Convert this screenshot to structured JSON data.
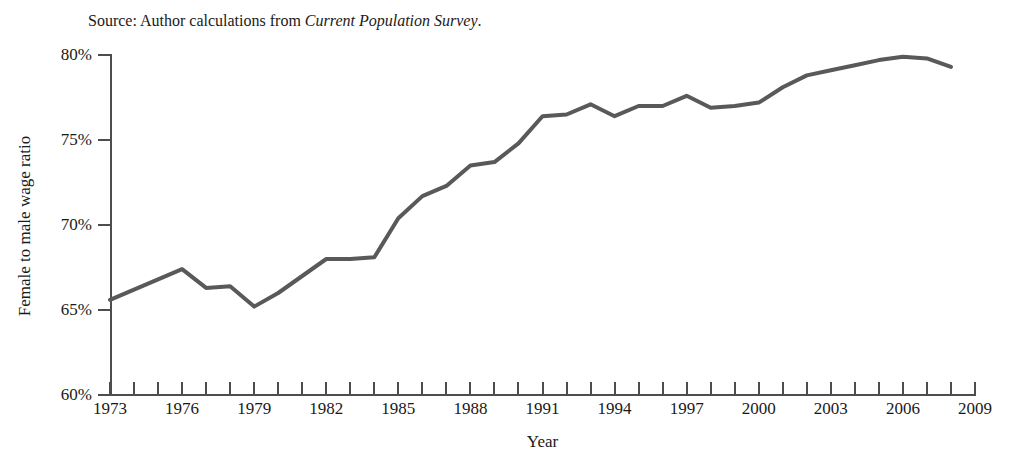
{
  "source_note": {
    "prefix": "Source: Author calculations from ",
    "italic_part": "Current Population Survey",
    "suffix": "."
  },
  "axes": {
    "x_title": "Year",
    "y_title": "Female to male wage ratio",
    "y_tick_labels": [
      "80%",
      "75%",
      "70%",
      "65%",
      "60%"
    ],
    "x_tick_labels": [
      "1973",
      "1976",
      "1979",
      "1982",
      "1985",
      "1988",
      "1991",
      "1994",
      "1997",
      "2000",
      "2003",
      "2006",
      "2009"
    ]
  },
  "style": {
    "line_color": "#595959",
    "axis_color": "#4d4d4d",
    "text_color": "#1a1a1a",
    "background": "#ffffff",
    "line_width": 4
  },
  "chart_data": {
    "type": "line",
    "title": "",
    "subtitle": "",
    "xlabel": "Year",
    "ylabel": "Female to male wage ratio",
    "xlim": [
      1973,
      2009
    ],
    "ylim": [
      60,
      80
    ],
    "ytick_values": [
      60,
      65,
      70,
      75,
      80
    ],
    "ytick_labels": [
      "60%",
      "65%",
      "70%",
      "75%",
      "80%"
    ],
    "xtick_values": [
      1973,
      1974,
      1975,
      1976,
      1977,
      1978,
      1979,
      1980,
      1981,
      1982,
      1983,
      1984,
      1985,
      1986,
      1987,
      1988,
      1989,
      1990,
      1991,
      1992,
      1993,
      1994,
      1995,
      1996,
      1997,
      1998,
      1999,
      2000,
      2001,
      2002,
      2003,
      2004,
      2005,
      2006,
      2007,
      2008,
      2009
    ],
    "xtick_labeled": [
      1973,
      1976,
      1979,
      1982,
      1985,
      1988,
      1991,
      1994,
      1997,
      2000,
      2003,
      2006,
      2009
    ],
    "grid": false,
    "legend": false,
    "annotations": [
      "Source: Author calculations from Current Population Survey."
    ],
    "x": [
      1973,
      1974,
      1975,
      1976,
      1977,
      1978,
      1979,
      1980,
      1981,
      1982,
      1983,
      1984,
      1985,
      1986,
      1987,
      1988,
      1989,
      1990,
      1991,
      1992,
      1993,
      1994,
      1995,
      1996,
      1997,
      1998,
      1999,
      2000,
      2001,
      2002,
      2003,
      2004,
      2005,
      2006,
      2007,
      2008
    ],
    "y": [
      65.6,
      66.2,
      66.8,
      67.4,
      66.3,
      66.4,
      65.2,
      66.0,
      67.0,
      68.0,
      68.0,
      68.1,
      70.4,
      71.7,
      72.3,
      73.5,
      73.7,
      74.8,
      76.4,
      76.5,
      77.1,
      76.4,
      77.0,
      77.0,
      77.6,
      76.9,
      77.0,
      77.2,
      78.1,
      78.8,
      79.1,
      79.4,
      79.7,
      79.9,
      79.8,
      79.3
    ],
    "series": [
      {
        "name": "Female to male wage ratio",
        "values": [
          65.6,
          66.2,
          66.8,
          67.4,
          66.3,
          66.4,
          65.2,
          66.0,
          67.0,
          68.0,
          68.0,
          68.1,
          70.4,
          71.7,
          72.3,
          73.5,
          73.7,
          74.8,
          76.4,
          76.5,
          77.1,
          76.4,
          77.0,
          77.0,
          77.6,
          76.9,
          77.0,
          77.2,
          78.1,
          78.8,
          79.1,
          79.4,
          79.7,
          79.9,
          79.8,
          79.3
        ]
      }
    ]
  }
}
